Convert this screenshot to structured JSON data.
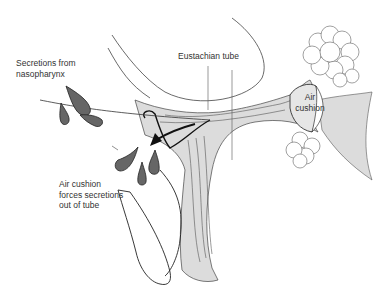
{
  "diagram": {
    "labels": {
      "secretions": "Secretions from\nnasopharynx",
      "eustachian_tube": "Eustachian tube",
      "air_cushion": "Air\ncushion",
      "air_cushion_forces": "Air cushion\nforces secretions\nout of tube"
    },
    "colors": {
      "tissue_fill": "#dcdcdc",
      "tissue_light": "#ebebeb",
      "outline": "#222222",
      "droplet_fill": "#666666",
      "text": "#333333",
      "background": "#ffffff"
    }
  }
}
